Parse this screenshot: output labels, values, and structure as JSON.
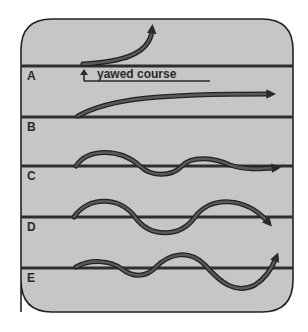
{
  "diagram": {
    "colors": {
      "panel_fill": "#c6c6c6",
      "panel_border": "#222222",
      "course_line": "#2e2e2e",
      "path_outline": "#222222",
      "path_fill": "#5a5a5a"
    },
    "rows": [
      {
        "label": "A",
        "description": "path curves sharply away from course (yawed)"
      },
      {
        "label": "B",
        "description": "path curves gently and continues parallel, offset"
      },
      {
        "label": "C",
        "description": "damped oscillation converging on course"
      },
      {
        "label": "D",
        "description": "steady oscillation about course"
      },
      {
        "label": "E",
        "description": "growing oscillation diverging from course"
      }
    ],
    "annotation": {
      "text": "yawed course"
    }
  }
}
